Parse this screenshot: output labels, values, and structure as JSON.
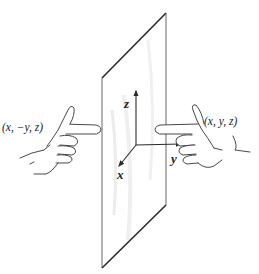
{
  "figure": {
    "colors": {
      "background": "#ffffff",
      "stroke": "#2a2a2a",
      "plane_shade": "#e6e6e6",
      "text": "#222222"
    },
    "labels": {
      "left_point": "(x, −y, z)",
      "right_point": "(x, y, z)"
    },
    "axes": {
      "z": "z",
      "y": "y",
      "x": "x"
    },
    "icons": {
      "left_hand": "left-pointing-hand-icon",
      "right_hand": "right-pointing-hand-icon"
    }
  }
}
